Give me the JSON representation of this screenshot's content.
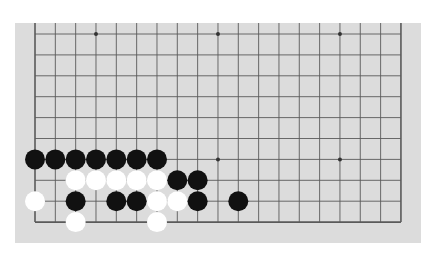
{
  "board": {
    "type": "go-board-partial",
    "columns": 19,
    "visible_rows": 10,
    "colors": {
      "background": "#dcdcdc",
      "line": "#5a5a5a",
      "black_stone": "#111111",
      "white_stone": "#ffffff"
    },
    "star_points": [
      {
        "col": 3,
        "row": 0
      },
      {
        "col": 9,
        "row": 0
      },
      {
        "col": 15,
        "row": 0
      },
      {
        "col": 3,
        "row": 6
      },
      {
        "col": 9,
        "row": 6
      },
      {
        "col": 15,
        "row": 6
      }
    ],
    "stones": [
      {
        "col": 0,
        "row": 6,
        "color": "black"
      },
      {
        "col": 1,
        "row": 6,
        "color": "black"
      },
      {
        "col": 2,
        "row": 6,
        "color": "black"
      },
      {
        "col": 3,
        "row": 6,
        "color": "black"
      },
      {
        "col": 4,
        "row": 6,
        "color": "black"
      },
      {
        "col": 5,
        "row": 6,
        "color": "black"
      },
      {
        "col": 6,
        "row": 6,
        "color": "black"
      },
      {
        "col": 2,
        "row": 7,
        "color": "white"
      },
      {
        "col": 3,
        "row": 7,
        "color": "white"
      },
      {
        "col": 4,
        "row": 7,
        "color": "white"
      },
      {
        "col": 5,
        "row": 7,
        "color": "white"
      },
      {
        "col": 6,
        "row": 7,
        "color": "white"
      },
      {
        "col": 7,
        "row": 7,
        "color": "black"
      },
      {
        "col": 8,
        "row": 7,
        "color": "black"
      },
      {
        "col": 0,
        "row": 8,
        "color": "white"
      },
      {
        "col": 2,
        "row": 8,
        "color": "black"
      },
      {
        "col": 4,
        "row": 8,
        "color": "black"
      },
      {
        "col": 5,
        "row": 8,
        "color": "black"
      },
      {
        "col": 6,
        "row": 8,
        "color": "white"
      },
      {
        "col": 7,
        "row": 8,
        "color": "white"
      },
      {
        "col": 8,
        "row": 8,
        "color": "black"
      },
      {
        "col": 10,
        "row": 8,
        "color": "black"
      },
      {
        "col": 2,
        "row": 9,
        "color": "white"
      },
      {
        "col": 6,
        "row": 9,
        "color": "white"
      }
    ]
  }
}
